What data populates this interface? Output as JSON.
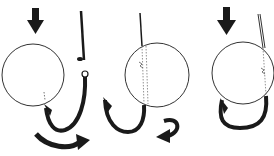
{
  "figure": {
    "colors": {
      "background": "#ffffff",
      "ink": "#1a1a1a",
      "outline": "#333333"
    },
    "panels": [
      {
        "id": 1,
        "elements": [
          "down-arrow",
          "bait-circle",
          "hook",
          "curved-arrow-right"
        ]
      },
      {
        "id": 2,
        "elements": [
          "bait-circle",
          "hook-through-bait",
          "curved-arrow-back"
        ]
      },
      {
        "id": 3,
        "elements": [
          "down-arrow",
          "bait-circle",
          "hook-threaded"
        ]
      }
    ]
  }
}
